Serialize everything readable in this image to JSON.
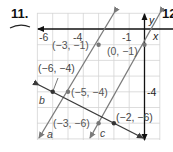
{
  "problem": {
    "number": "11.",
    "next_number": "12"
  },
  "axes": {
    "x_label": "x",
    "y_label": "y",
    "x_ticks": [
      "-6",
      "-4",
      "-1"
    ],
    "y_ticks": [
      "-4"
    ]
  },
  "lines": [
    {
      "name": "a",
      "label": "a",
      "color": "#7a7a7a",
      "points": [
        [
          -3,
          -1
        ],
        [
          -5,
          -4
        ]
      ]
    },
    {
      "name": "b",
      "label": "b",
      "color": "#3a3a3a",
      "points": [
        [
          -6,
          -4
        ],
        [
          -2,
          -6
        ]
      ]
    },
    {
      "name": "c",
      "label": "c",
      "color": "#7a7a7a",
      "points": [
        [
          0,
          -1
        ],
        [
          -3,
          -6
        ]
      ]
    }
  ],
  "point_labels": {
    "p1": "(−3, −1)",
    "p2": "(0, −1)",
    "p3": "(−6, −4)",
    "p4": "(−5, −4)",
    "p5": "(−3, −6)",
    "p6": "(−2, −6)"
  }
}
